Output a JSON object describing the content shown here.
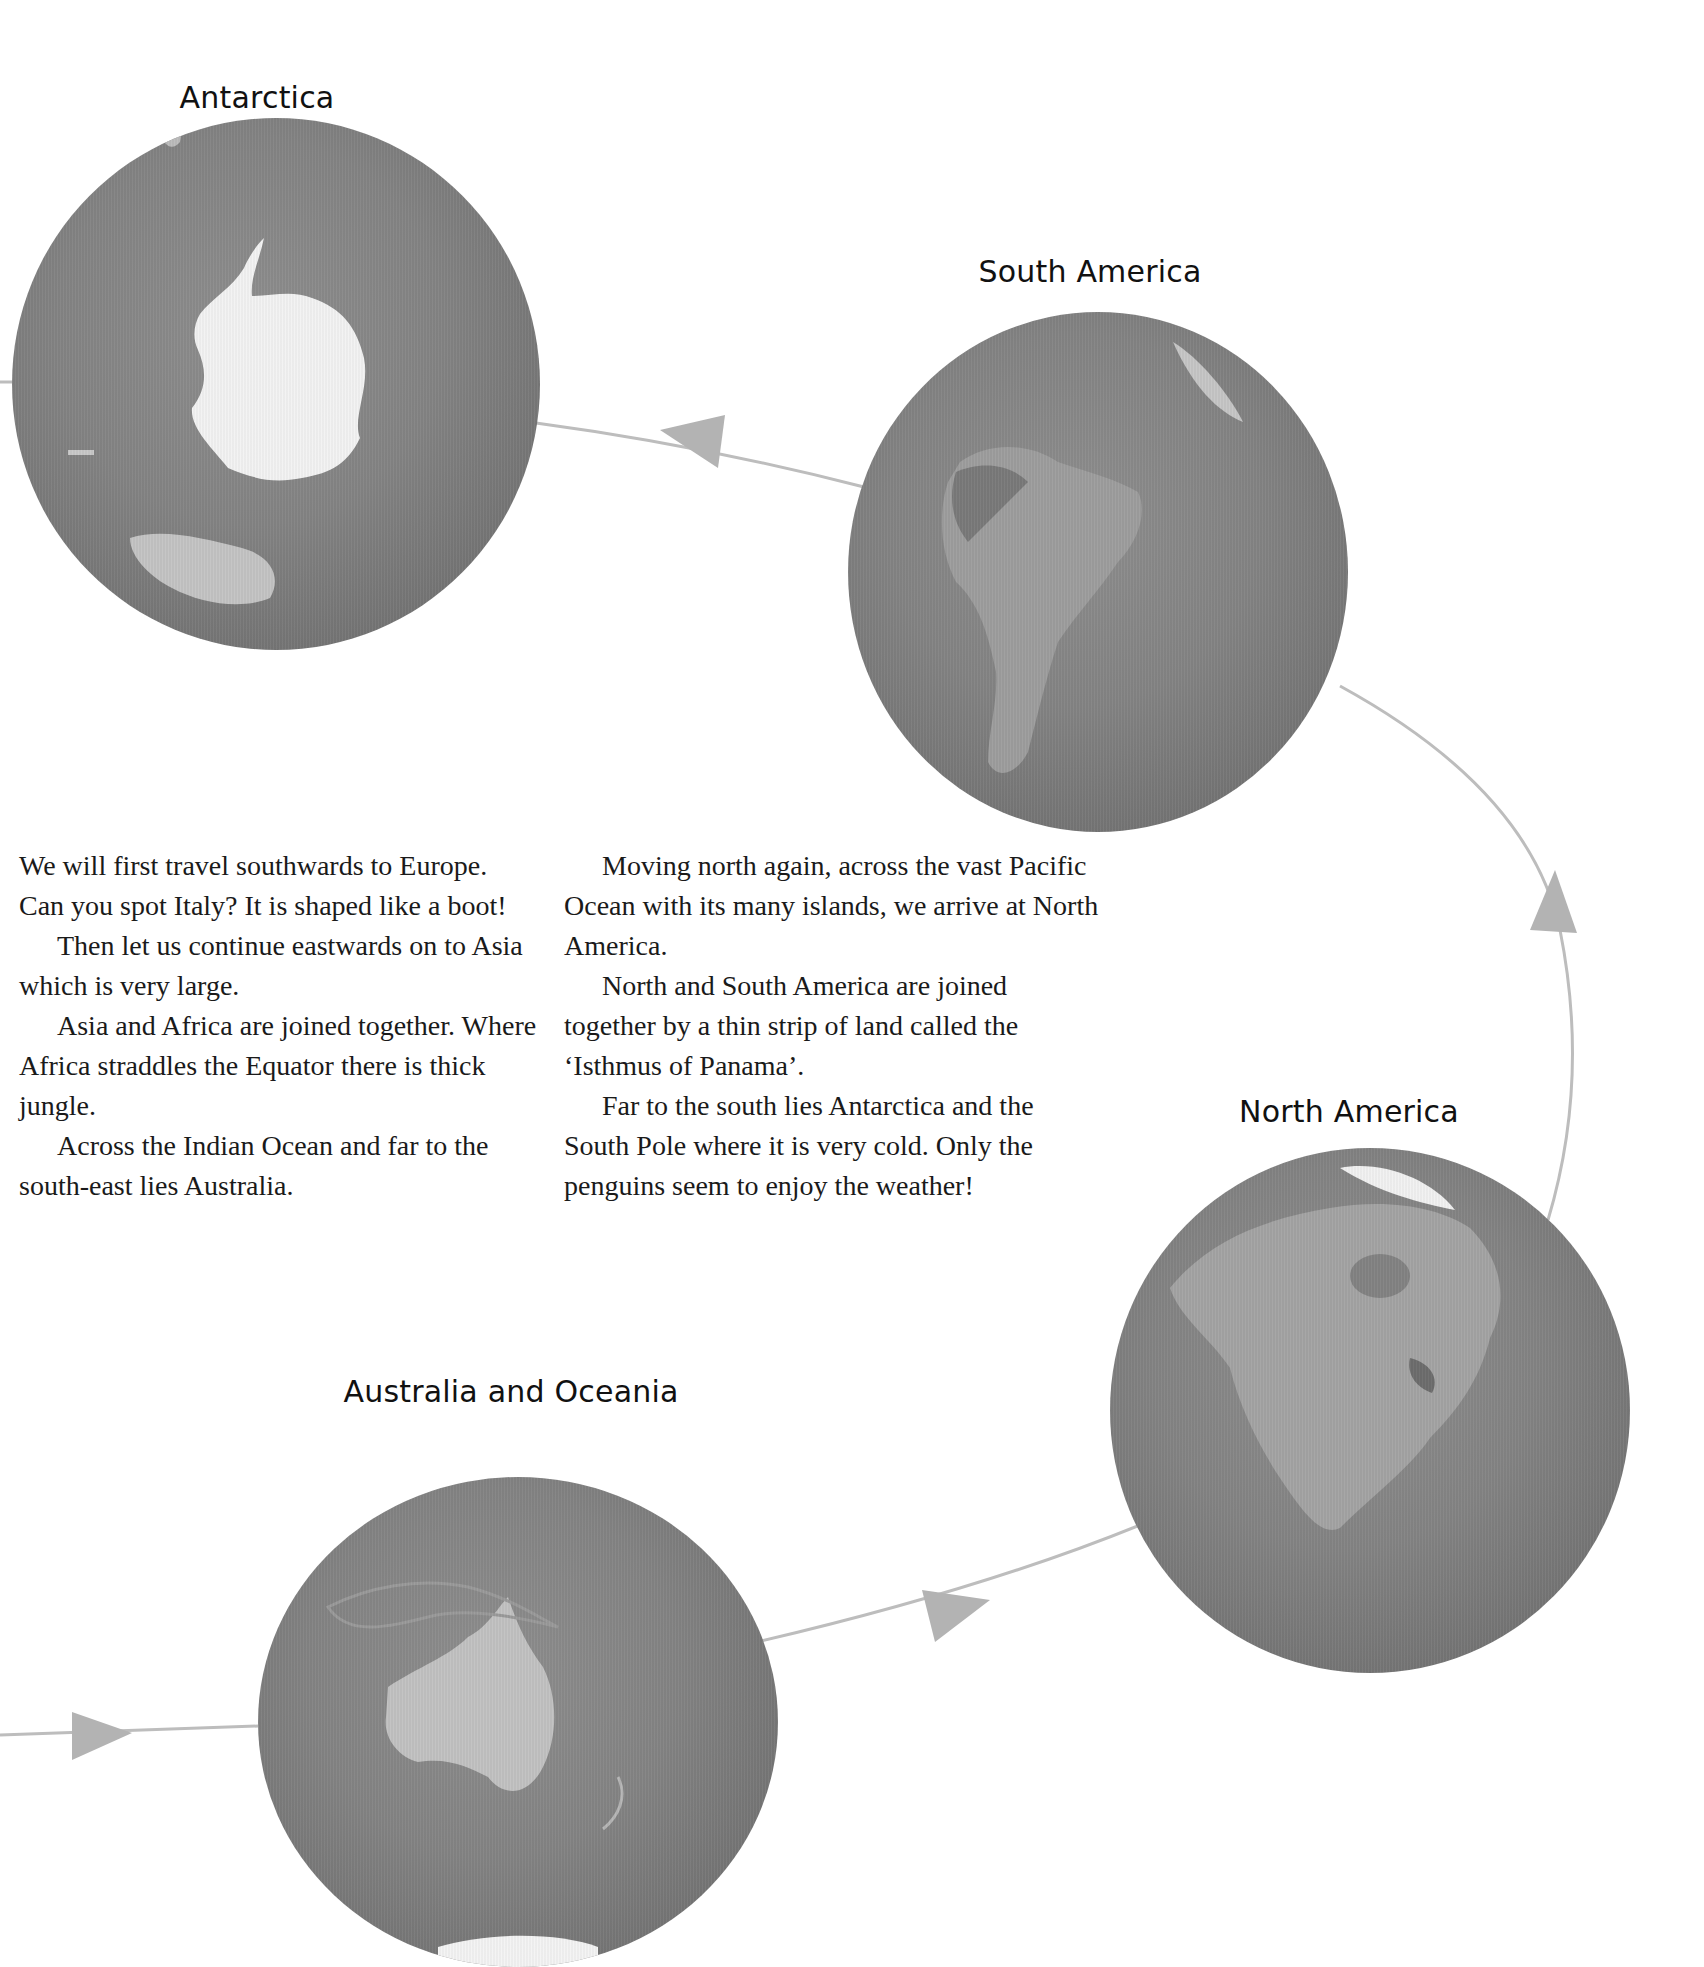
{
  "globes": [
    {
      "id": "antarctica",
      "label": "Antarctica"
    },
    {
      "id": "south-america",
      "label": "South America"
    },
    {
      "id": "north-america",
      "label": "North America"
    },
    {
      "id": "australia",
      "label": "Australia and Oceania"
    }
  ],
  "text": {
    "left_column": [
      "We will first travel southwards to Europe. Can you spot Italy? It is shaped like a boot!",
      "Then let us continue eastwards on to Asia which is very large.",
      "Asia and Africa are joined together. Where Africa straddles the Equator there is thick jungle.",
      "Across the Indian Ocean and far to the south-east lies Australia."
    ],
    "right_column": [
      "Moving north again, across the vast Pacific Ocean with its many islands, we arrive at North America.",
      "North and South America are joined together by a thin strip of land called the ‘Isthmus of Panama’.",
      "Far to the south lies Antarctica and the South Pole where it is very cold. Only the penguins seem to enjoy the weather!"
    ]
  },
  "colors": {
    "path_line": "#b8b8b8",
    "arrow": "#b0b0b0",
    "ocean": "#848484",
    "ice": "#f4f4f4"
  }
}
